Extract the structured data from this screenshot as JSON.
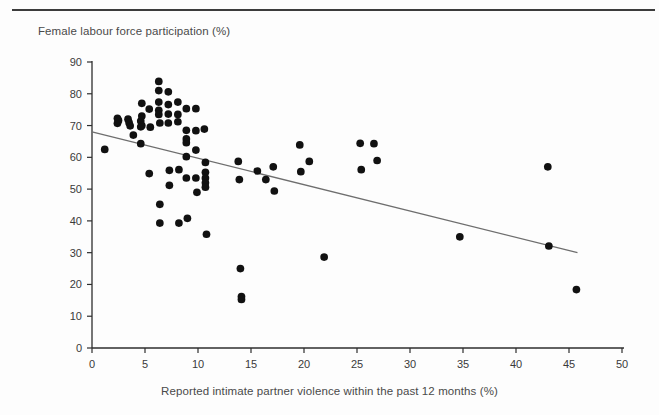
{
  "figure": {
    "y_axis_title": "Female labour force participation (%)",
    "x_axis_title": "Reported intimate partner violence within the past 12 months (%)"
  },
  "chart_data": {
    "type": "scatter",
    "title": "",
    "xlabel": "Reported intimate partner violence within the past 12 months (%)",
    "ylabel": "Female labour force participation (%)",
    "xlim": [
      0,
      50
    ],
    "ylim": [
      0,
      90
    ],
    "xticks": [
      0,
      5,
      10,
      15,
      20,
      25,
      30,
      35,
      40,
      45,
      50
    ],
    "yticks": [
      0,
      10,
      20,
      30,
      40,
      50,
      60,
      70,
      80,
      90
    ],
    "grid": false,
    "legend": null,
    "marker_color": "#111111",
    "marker_size": 5.2,
    "trendline": {
      "type": "linear",
      "color": "#6e6e6e",
      "x_start": 0.0,
      "y_start": 68.0,
      "x_end": 45.8,
      "y_end": 30.0
    },
    "points": [
      {
        "x": 1.2,
        "y": 62.5
      },
      {
        "x": 2.4,
        "y": 72.3
      },
      {
        "x": 2.4,
        "y": 70.7
      },
      {
        "x": 2.5,
        "y": 71.6
      },
      {
        "x": 3.4,
        "y": 72.0
      },
      {
        "x": 3.5,
        "y": 70.9
      },
      {
        "x": 3.6,
        "y": 69.9
      },
      {
        "x": 3.9,
        "y": 67.0
      },
      {
        "x": 4.6,
        "y": 71.4
      },
      {
        "x": 4.7,
        "y": 70.0
      },
      {
        "x": 4.6,
        "y": 69.6
      },
      {
        "x": 4.7,
        "y": 77.0
      },
      {
        "x": 4.7,
        "y": 73.0
      },
      {
        "x": 4.6,
        "y": 64.3
      },
      {
        "x": 5.4,
        "y": 75.2
      },
      {
        "x": 5.5,
        "y": 69.5
      },
      {
        "x": 5.4,
        "y": 54.9
      },
      {
        "x": 6.3,
        "y": 83.9
      },
      {
        "x": 6.3,
        "y": 81.0
      },
      {
        "x": 6.3,
        "y": 77.4
      },
      {
        "x": 6.3,
        "y": 74.8
      },
      {
        "x": 6.3,
        "y": 73.5
      },
      {
        "x": 6.4,
        "y": 70.8
      },
      {
        "x": 6.4,
        "y": 45.2
      },
      {
        "x": 6.4,
        "y": 39.3
      },
      {
        "x": 7.2,
        "y": 80.6
      },
      {
        "x": 7.2,
        "y": 76.6
      },
      {
        "x": 7.2,
        "y": 73.6
      },
      {
        "x": 7.2,
        "y": 70.8
      },
      {
        "x": 7.3,
        "y": 55.9
      },
      {
        "x": 7.3,
        "y": 51.2
      },
      {
        "x": 8.1,
        "y": 77.4
      },
      {
        "x": 8.1,
        "y": 73.5
      },
      {
        "x": 8.1,
        "y": 71.2
      },
      {
        "x": 8.2,
        "y": 56.1
      },
      {
        "x": 8.2,
        "y": 39.3
      },
      {
        "x": 8.9,
        "y": 75.3
      },
      {
        "x": 8.9,
        "y": 68.5
      },
      {
        "x": 8.9,
        "y": 65.8
      },
      {
        "x": 8.9,
        "y": 64.6
      },
      {
        "x": 8.9,
        "y": 60.2
      },
      {
        "x": 8.9,
        "y": 53.5
      },
      {
        "x": 9.0,
        "y": 40.8
      },
      {
        "x": 9.8,
        "y": 75.3
      },
      {
        "x": 9.8,
        "y": 68.4
      },
      {
        "x": 9.8,
        "y": 62.3
      },
      {
        "x": 9.8,
        "y": 53.5
      },
      {
        "x": 9.9,
        "y": 49.0
      },
      {
        "x": 10.6,
        "y": 68.9
      },
      {
        "x": 10.7,
        "y": 58.4
      },
      {
        "x": 10.7,
        "y": 55.3
      },
      {
        "x": 10.7,
        "y": 53.5
      },
      {
        "x": 10.7,
        "y": 52.0
      },
      {
        "x": 10.7,
        "y": 50.6
      },
      {
        "x": 10.8,
        "y": 35.8
      },
      {
        "x": 13.8,
        "y": 58.7
      },
      {
        "x": 13.9,
        "y": 53.0
      },
      {
        "x": 14.0,
        "y": 25.0
      },
      {
        "x": 14.1,
        "y": 16.2
      },
      {
        "x": 14.1,
        "y": 15.3
      },
      {
        "x": 15.6,
        "y": 55.7
      },
      {
        "x": 16.4,
        "y": 53.0
      },
      {
        "x": 17.1,
        "y": 57.0
      },
      {
        "x": 17.2,
        "y": 49.4
      },
      {
        "x": 19.6,
        "y": 63.9
      },
      {
        "x": 19.7,
        "y": 55.5
      },
      {
        "x": 20.5,
        "y": 58.7
      },
      {
        "x": 21.9,
        "y": 28.6
      },
      {
        "x": 25.3,
        "y": 64.4
      },
      {
        "x": 25.4,
        "y": 56.1
      },
      {
        "x": 26.6,
        "y": 64.3
      },
      {
        "x": 26.9,
        "y": 59.0
      },
      {
        "x": 34.7,
        "y": 35.0
      },
      {
        "x": 43.0,
        "y": 57.0
      },
      {
        "x": 43.1,
        "y": 32.1
      },
      {
        "x": 45.7,
        "y": 18.4
      }
    ]
  }
}
